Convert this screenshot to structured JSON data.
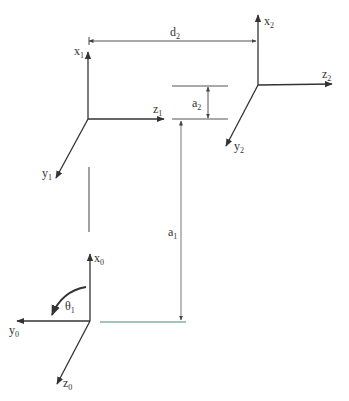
{
  "diagram": {
    "type": "kinematic-frames",
    "colors": {
      "stroke": "#333333",
      "dim_line": "#555555",
      "base_line": "#4a8a6a"
    },
    "frames": [
      {
        "id": "frame-0",
        "origin": [
          90,
          321
        ],
        "axes": [
          {
            "name": "x",
            "sub": "0",
            "end": [
              90,
              254
            ],
            "label_pos": [
              94,
              262
            ]
          },
          {
            "name": "y",
            "sub": "0",
            "end": [
              17,
              321
            ],
            "label_pos": [
              9,
              334
            ]
          },
          {
            "name": "z",
            "sub": "0",
            "end": [
              57,
              384
            ],
            "label_pos": [
              63,
              387
            ]
          }
        ]
      },
      {
        "id": "frame-1",
        "origin": [
          88,
          119
        ],
        "axes": [
          {
            "name": "x",
            "sub": "1",
            "end": [
              88,
              52
            ],
            "label_pos": [
              74,
              55
            ]
          },
          {
            "name": "z",
            "sub": "1",
            "end": [
              164,
              119
            ],
            "label_pos": [
              153,
              113
            ]
          },
          {
            "name": "y",
            "sub": "1",
            "end": [
              56,
              178
            ],
            "label_pos": [
              42,
              177
            ]
          }
        ]
      },
      {
        "id": "frame-2",
        "origin": [
          258,
          85
        ],
        "axes": [
          {
            "name": "x",
            "sub": "2",
            "end": [
              258,
              15
            ],
            "label_pos": [
              264,
              25
            ]
          },
          {
            "name": "z",
            "sub": "2",
            "end": [
              332,
              84
            ],
            "label_pos": [
              322,
              78
            ]
          },
          {
            "name": "y",
            "sub": "2",
            "end": [
              226,
              146
            ],
            "label_pos": [
              234,
              150
            ]
          }
        ]
      }
    ],
    "dimensions": [
      {
        "label": "d",
        "sub": "2",
        "label_pos": [
          170,
          36
        ]
      },
      {
        "label": "a",
        "sub": "2",
        "label_pos": [
          192,
          107
        ]
      },
      {
        "label": "a",
        "sub": "1",
        "label_pos": [
          168,
          236
        ]
      }
    ],
    "angle": {
      "label": "θ",
      "sub": "1",
      "label_pos": [
        65,
        310
      ]
    }
  }
}
